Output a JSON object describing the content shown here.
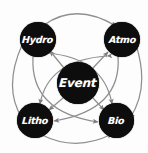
{
  "diagram": {
    "type": "node-link-diagram",
    "shape": "circular-ring-with-center",
    "background_color": "#fdfdfd",
    "node_color": "#0d0d0d",
    "node_text_color": "#ffffff",
    "edge_color": "#8f8f8f",
    "nodes": [
      {
        "id": "hydro",
        "label": "Hydro",
        "position": "top-left"
      },
      {
        "id": "atmo",
        "label": "Atmo",
        "position": "top-right"
      },
      {
        "id": "litho",
        "label": "Litho",
        "position": "bottom-left"
      },
      {
        "id": "bio",
        "label": "Bio",
        "position": "bottom-right"
      },
      {
        "id": "event",
        "label": "Event",
        "position": "center"
      }
    ],
    "edges": [
      {
        "from": "hydro",
        "to": "atmo",
        "style": "curved-arc",
        "arrows": "both"
      },
      {
        "from": "litho",
        "to": "bio",
        "style": "curved-arc",
        "arrows": "both"
      },
      {
        "from": "hydro",
        "to": "litho",
        "style": "curved-arc",
        "arrows": "both"
      },
      {
        "from": "atmo",
        "to": "bio",
        "style": "curved-arc",
        "arrows": "both"
      },
      {
        "from": "event",
        "to": "hydro",
        "style": "diagonal",
        "arrows": "both"
      },
      {
        "from": "event",
        "to": "atmo",
        "style": "diagonal",
        "arrows": "both"
      },
      {
        "from": "event",
        "to": "litho",
        "style": "diagonal",
        "arrows": "both"
      },
      {
        "from": "event",
        "to": "bio",
        "style": "diagonal",
        "arrows": "both"
      },
      {
        "from": "hydro",
        "to": "bio",
        "style": "cross-curve",
        "arrows": "both"
      },
      {
        "from": "atmo",
        "to": "litho",
        "style": "cross-curve",
        "arrows": "both"
      }
    ]
  }
}
